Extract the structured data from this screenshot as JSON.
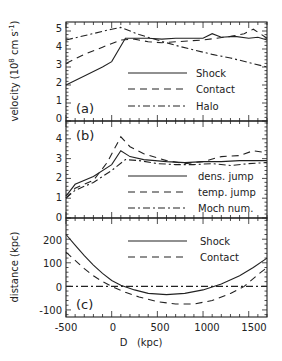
{
  "chart_data": [
    {
      "panel": "(a)",
      "type": "line",
      "ylabel": "velocity (10^8 cm s^-1)",
      "ylabel_parts": {
        "pre": "velocity (10",
        "sup1": "8",
        "mid": " cm s",
        "sup2": "-1",
        "post": ")"
      },
      "xlabel": "D (kpc)",
      "xlim": [
        -500,
        1700
      ],
      "ylim": [
        0,
        5.5
      ],
      "yticks": [
        0,
        1,
        2,
        3,
        4,
        5
      ],
      "panel_label": "(a)",
      "legend": [
        "Shock",
        "Contact",
        "Halo"
      ],
      "series": [
        {
          "name": "Shock",
          "style": "solid",
          "x": [
            -500,
            -300,
            -100,
            0,
            150,
            250,
            400,
            550,
            700,
            850,
            1000,
            1100,
            1200,
            1350,
            1500,
            1600,
            1700
          ],
          "y": [
            2.0,
            2.5,
            3.0,
            3.3,
            4.6,
            4.6,
            4.6,
            4.55,
            4.6,
            4.6,
            4.6,
            4.85,
            4.65,
            4.7,
            4.6,
            4.65,
            4.5
          ]
        },
        {
          "name": "Contact",
          "style": "dashed",
          "x": [
            -500,
            -300,
            -100,
            100,
            250,
            400,
            550,
            700,
            850,
            1000,
            1150,
            1300,
            1450,
            1550,
            1700
          ],
          "y": [
            3.2,
            3.7,
            4.1,
            4.5,
            4.55,
            4.4,
            4.35,
            4.4,
            4.45,
            4.5,
            4.6,
            4.7,
            4.85,
            5.1,
            4.6
          ]
        },
        {
          "name": "Halo",
          "style": "dashdot",
          "x": [
            -500,
            -250,
            0,
            100,
            300,
            500,
            700,
            900,
            1100,
            1300,
            1500,
            1700
          ],
          "y": [
            4.5,
            4.8,
            5.1,
            5.2,
            4.8,
            4.5,
            4.2,
            3.95,
            3.7,
            3.5,
            3.25,
            3.0
          ]
        }
      ]
    },
    {
      "panel": "(b)",
      "type": "line",
      "ylabel": "",
      "xlim": [
        -500,
        1700
      ],
      "ylim": [
        0,
        4.9
      ],
      "yticks": [
        0,
        1,
        2,
        3,
        4
      ],
      "panel_label": "(b)",
      "legend": [
        "dens. jump",
        "temp. jump",
        "Moch num."
      ],
      "series": [
        {
          "name": "dens. jump",
          "style": "solid",
          "x": [
            -500,
            -400,
            -200,
            0,
            100,
            200,
            350,
            600,
            800,
            1000,
            1200,
            1400,
            1700
          ],
          "y": [
            1.1,
            1.7,
            2.1,
            2.7,
            3.4,
            3.1,
            2.95,
            2.85,
            2.8,
            2.85,
            2.85,
            2.9,
            2.9
          ]
        },
        {
          "name": "temp. jump",
          "style": "dashed",
          "x": [
            -500,
            -400,
            -200,
            -50,
            100,
            200,
            350,
            600,
            800,
            1000,
            1200,
            1400,
            1550,
            1700
          ],
          "y": [
            1.0,
            1.5,
            1.9,
            2.8,
            4.1,
            3.6,
            3.25,
            2.9,
            2.75,
            2.85,
            3.1,
            3.15,
            3.4,
            3.3
          ]
        },
        {
          "name": "Moch num.",
          "style": "dashdot",
          "x": [
            -500,
            -400,
            -200,
            0,
            150,
            300,
            500,
            700,
            900,
            1100,
            1300,
            1500,
            1700
          ],
          "y": [
            1.0,
            1.4,
            1.8,
            2.4,
            2.95,
            2.9,
            2.75,
            2.7,
            2.7,
            2.75,
            2.65,
            2.75,
            2.8
          ]
        }
      ]
    },
    {
      "panel": "(c)",
      "type": "line",
      "ylabel": "distance (kpc)",
      "xlabel": "D (kpc)",
      "xlim": [
        -500,
        1700
      ],
      "ylim": [
        -130,
        290
      ],
      "yticks": [
        -100,
        0,
        100,
        200
      ],
      "xticks": [
        -500,
        0,
        500,
        1000,
        1500
      ],
      "panel_label": "(c)",
      "legend": [
        "Shock",
        "Contact"
      ],
      "series": [
        {
          "name": "Shock",
          "style": "solid",
          "x": [
            -500,
            -400,
            -300,
            -200,
            -100,
            0,
            100,
            250,
            400,
            600,
            800,
            1000,
            1200,
            1400,
            1550,
            1700
          ],
          "y": [
            220,
            175,
            130,
            90,
            55,
            25,
            5,
            -15,
            -30,
            -35,
            -30,
            -15,
            10,
            45,
            80,
            120
          ]
        },
        {
          "name": "Contact",
          "style": "dashed",
          "x": [
            -500,
            -400,
            -300,
            -200,
            -100,
            0,
            150,
            300,
            500,
            700,
            900,
            1100,
            1300,
            1450,
            1600,
            1700
          ],
          "y": [
            145,
            110,
            75,
            45,
            20,
            0,
            -25,
            -45,
            -65,
            -75,
            -75,
            -60,
            -30,
            0,
            50,
            80
          ]
        },
        {
          "name": "reference",
          "style": "dashdot",
          "x": [
            -500,
            1700
          ],
          "y": [
            0,
            0
          ]
        }
      ]
    }
  ],
  "axes": {
    "x_tick_labels": [
      "-500",
      "0",
      "500",
      "1000",
      "1500"
    ],
    "xlabel": "D   (kpc)",
    "panel_a_ytick_labels": [
      "0",
      "1",
      "2",
      "3",
      "4",
      "5"
    ],
    "panel_b_ytick_labels": [
      "0",
      "1",
      "2",
      "3",
      "4"
    ],
    "panel_c_ytick_labels": [
      "-100",
      "0",
      "100",
      "200"
    ],
    "velocity_label": "velocity (10",
    "velocity_sup1": "8",
    "velocity_mid": " cm s",
    "velocity_sup2": "-1",
    "velocity_end": ")",
    "distance_label": "distance (kpc)"
  },
  "panels": {
    "a": {
      "label": "(a)",
      "legend": [
        {
          "text": "Shock"
        },
        {
          "text": "Contact"
        },
        {
          "text": "Halo"
        }
      ]
    },
    "b": {
      "label": "(b)",
      "legend": [
        {
          "text": "dens. jump"
        },
        {
          "text": "temp. jump"
        },
        {
          "text": "Moch num."
        }
      ]
    },
    "c": {
      "label": "(c)",
      "legend": [
        {
          "text": "Shock"
        },
        {
          "text": "Contact"
        }
      ]
    }
  }
}
